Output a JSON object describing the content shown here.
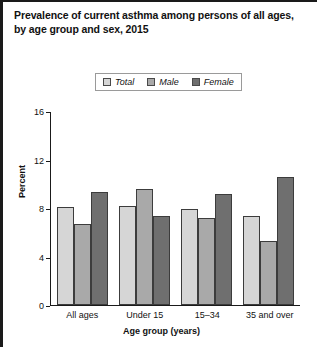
{
  "title": {
    "line1": "Prevalence of current asthma among persons of all ages,",
    "line2": "by age group and sex, 2015"
  },
  "legend": {
    "items": [
      {
        "label": "Total",
        "color": "#d6d6d6"
      },
      {
        "label": "Male",
        "color": "#a9a9a9"
      },
      {
        "label": "Female",
        "color": "#6f6f6f"
      }
    ]
  },
  "axes": {
    "y_title": "Percent",
    "x_title": "Age group (years)",
    "y_ticks": [
      "0",
      "4",
      "8",
      "12",
      "16"
    ]
  },
  "chart_data": {
    "type": "bar",
    "title": "Prevalence of current asthma among persons of all ages, by age group and sex, 2015",
    "xlabel": "Age group (years)",
    "ylabel": "Percent",
    "ylim": [
      0,
      16
    ],
    "yticks": [
      0,
      4,
      8,
      12,
      16
    ],
    "grid": false,
    "legend_position": "top-center",
    "categories": [
      "All ages",
      "Under 15",
      "15–34",
      "35 and over"
    ],
    "series": [
      {
        "name": "Total",
        "color": "#d6d6d6",
        "values": [
          8.1,
          8.2,
          8.0,
          7.4
        ]
      },
      {
        "name": "Male",
        "color": "#a9a9a9",
        "values": [
          6.7,
          9.6,
          7.2,
          5.3
        ]
      },
      {
        "name": "Female",
        "color": "#6f6f6f",
        "values": [
          9.4,
          7.4,
          9.2,
          10.6
        ]
      }
    ]
  }
}
